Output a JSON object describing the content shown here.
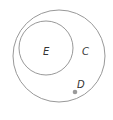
{
  "diagram": {
    "type": "venn",
    "sets": [
      {
        "id": "C",
        "label": "C",
        "cx": 59,
        "cy": 56,
        "r": 46
      },
      {
        "id": "E",
        "label": "E",
        "cx": 46,
        "cy": 48,
        "r": 27
      }
    ],
    "points": [
      {
        "id": "D",
        "label": "D",
        "x": 75,
        "y": 92
      }
    ],
    "colors": {
      "stroke": "#8c8c8c",
      "point": "#9a9a9a",
      "text": "#333333",
      "background": "#ffffff"
    }
  }
}
